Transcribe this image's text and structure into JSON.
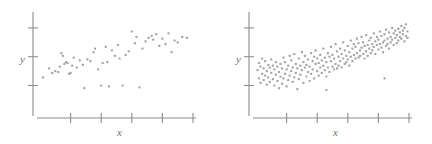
{
  "figure": {
    "background": "#ffffff",
    "dot_color": "#a6a6a6",
    "axis_color": "#8c8c8c",
    "label_color": "#6f6f6f",
    "width": 432,
    "height": 144
  },
  "chart_data": [
    {
      "type": "scatter",
      "title": "",
      "xlabel": "x",
      "ylabel": "y",
      "panel": "left",
      "grid": false,
      "legend": null,
      "xlim": [
        0,
        100
      ],
      "ylim": [
        0,
        100
      ],
      "x_ticks": [
        20,
        40,
        60,
        80,
        100
      ],
      "y_ticks": [
        25,
        57,
        89
      ],
      "n_points": 55,
      "correlation": "weak positive",
      "points": [
        [
          2,
          34
        ],
        [
          6,
          44
        ],
        [
          8,
          39
        ],
        [
          10,
          41
        ],
        [
          12,
          40
        ],
        [
          13,
          46
        ],
        [
          14,
          61
        ],
        [
          15,
          58
        ],
        [
          16,
          49
        ],
        [
          17,
          51
        ],
        [
          18,
          50
        ],
        [
          19,
          38
        ],
        [
          20,
          39
        ],
        [
          21,
          47
        ],
        [
          22,
          56
        ],
        [
          24,
          45
        ],
        [
          26,
          53
        ],
        [
          28,
          48
        ],
        [
          29,
          22
        ],
        [
          31,
          54
        ],
        [
          33,
          52
        ],
        [
          35,
          62
        ],
        [
          36,
          66
        ],
        [
          38,
          43
        ],
        [
          40,
          25
        ],
        [
          41,
          50
        ],
        [
          43,
          68
        ],
        [
          44,
          51
        ],
        [
          45,
          24
        ],
        [
          47,
          64
        ],
        [
          49,
          58
        ],
        [
          51,
          70
        ],
        [
          52,
          55
        ],
        [
          54,
          25
        ],
        [
          56,
          59
        ],
        [
          58,
          63
        ],
        [
          60,
          85
        ],
        [
          62,
          72
        ],
        [
          63,
          79
        ],
        [
          65,
          23
        ],
        [
          67,
          66
        ],
        [
          69,
          74
        ],
        [
          71,
          78
        ],
        [
          73,
          80
        ],
        [
          74,
          76
        ],
        [
          76,
          82
        ],
        [
          78,
          69
        ],
        [
          80,
          77
        ],
        [
          82,
          71
        ],
        [
          84,
          83
        ],
        [
          86,
          62
        ],
        [
          88,
          75
        ],
        [
          90,
          73
        ],
        [
          93,
          79
        ],
        [
          96,
          78
        ]
      ]
    },
    {
      "type": "scatter",
      "title": "",
      "xlabel": "x",
      "ylabel": "y",
      "panel": "right",
      "grid": false,
      "legend": null,
      "xlim": [
        0,
        100
      ],
      "ylim": [
        0,
        100
      ],
      "x_ticks": [
        20,
        40,
        60,
        80,
        100
      ],
      "y_ticks": [
        25,
        57,
        89
      ],
      "n_points": 200,
      "correlation": "moderate positive",
      "points": [
        [
          1,
          42
        ],
        [
          2,
          33
        ],
        [
          2,
          50
        ],
        [
          3,
          28
        ],
        [
          3,
          46
        ],
        [
          4,
          38
        ],
        [
          4,
          55
        ],
        [
          5,
          31
        ],
        [
          5,
          44
        ],
        [
          6,
          36
        ],
        [
          6,
          52
        ],
        [
          7,
          26
        ],
        [
          7,
          41
        ],
        [
          8,
          48
        ],
        [
          8,
          34
        ],
        [
          9,
          29
        ],
        [
          9,
          45
        ],
        [
          10,
          39
        ],
        [
          10,
          54
        ],
        [
          11,
          32
        ],
        [
          11,
          47
        ],
        [
          12,
          25
        ],
        [
          12,
          43
        ],
        [
          13,
          37
        ],
        [
          13,
          51
        ],
        [
          14,
          30
        ],
        [
          14,
          46
        ],
        [
          15,
          22
        ],
        [
          15,
          40
        ],
        [
          16,
          35
        ],
        [
          16,
          49
        ],
        [
          17,
          27
        ],
        [
          17,
          44
        ],
        [
          18,
          56
        ],
        [
          18,
          33
        ],
        [
          19,
          38
        ],
        [
          19,
          51
        ],
        [
          20,
          24
        ],
        [
          20,
          43
        ],
        [
          21,
          47
        ],
        [
          21,
          31
        ],
        [
          22,
          58
        ],
        [
          22,
          36
        ],
        [
          23,
          41
        ],
        [
          23,
          53
        ],
        [
          24,
          29
        ],
        [
          24,
          45
        ],
        [
          25,
          34
        ],
        [
          25,
          60
        ],
        [
          26,
          39
        ],
        [
          26,
          49
        ],
        [
          27,
          21
        ],
        [
          27,
          44
        ],
        [
          28,
          55
        ],
        [
          28,
          32
        ],
        [
          29,
          47
        ],
        [
          29,
          37
        ],
        [
          30,
          62
        ],
        [
          30,
          42
        ],
        [
          31,
          51
        ],
        [
          31,
          28
        ],
        [
          32,
          45
        ],
        [
          32,
          58
        ],
        [
          33,
          35
        ],
        [
          33,
          48
        ],
        [
          34,
          40
        ],
        [
          34,
          54
        ],
        [
          35,
          30
        ],
        [
          35,
          46
        ],
        [
          36,
          61
        ],
        [
          36,
          38
        ],
        [
          37,
          52
        ],
        [
          37,
          43
        ],
        [
          38,
          57
        ],
        [
          38,
          33
        ],
        [
          39,
          49
        ],
        [
          39,
          64
        ],
        [
          40,
          41
        ],
        [
          40,
          55
        ],
        [
          41,
          36
        ],
        [
          41,
          50
        ],
        [
          42,
          45
        ],
        [
          42,
          59
        ],
        [
          43,
          39
        ],
        [
          43,
          53
        ],
        [
          44,
          66
        ],
        [
          44,
          47
        ],
        [
          45,
          42
        ],
        [
          45,
          56
        ],
        [
          46,
          35
        ],
        [
          46,
          51
        ],
        [
          47,
          61
        ],
        [
          47,
          45
        ],
        [
          48,
          57
        ],
        [
          48,
          40
        ],
        [
          49,
          52
        ],
        [
          49,
          68
        ],
        [
          50,
          46
        ],
        [
          50,
          59
        ],
        [
          51,
          43
        ],
        [
          51,
          55
        ],
        [
          52,
          71
        ],
        [
          52,
          49
        ],
        [
          53,
          63
        ],
        [
          53,
          44
        ],
        [
          54,
          57
        ],
        [
          54,
          47
        ],
        [
          55,
          66
        ],
        [
          55,
          52
        ],
        [
          56,
          60
        ],
        [
          56,
          45
        ],
        [
          57,
          73
        ],
        [
          57,
          55
        ],
        [
          58,
          49
        ],
        [
          58,
          64
        ],
        [
          59,
          58
        ],
        [
          59,
          51
        ],
        [
          60,
          69
        ],
        [
          60,
          54
        ],
        [
          61,
          62
        ],
        [
          61,
          47
        ],
        [
          62,
          75
        ],
        [
          62,
          57
        ],
        [
          63,
          66
        ],
        [
          63,
          52
        ],
        [
          64,
          71
        ],
        [
          64,
          59
        ],
        [
          65,
          55
        ],
        [
          65,
          68
        ],
        [
          66,
          77
        ],
        [
          66,
          61
        ],
        [
          67,
          56
        ],
        [
          67,
          72
        ],
        [
          68,
          64
        ],
        [
          68,
          58
        ],
        [
          69,
          79
        ],
        [
          69,
          67
        ],
        [
          70,
          60
        ],
        [
          70,
          73
        ],
        [
          71,
          55
        ],
        [
          71,
          69
        ],
        [
          72,
          81
        ],
        [
          72,
          63
        ],
        [
          73,
          70
        ],
        [
          73,
          58
        ],
        [
          74,
          75
        ],
        [
          74,
          66
        ],
        [
          75,
          61
        ],
        [
          75,
          78
        ],
        [
          76,
          71
        ],
        [
          76,
          64
        ],
        [
          77,
          83
        ],
        [
          77,
          68
        ],
        [
          78,
          74
        ],
        [
          78,
          60
        ],
        [
          79,
          79
        ],
        [
          79,
          70
        ],
        [
          80,
          65
        ],
        [
          80,
          76
        ],
        [
          81,
          85
        ],
        [
          81,
          71
        ],
        [
          82,
          67
        ],
        [
          82,
          80
        ],
        [
          83,
          73
        ],
        [
          83,
          62
        ],
        [
          84,
          82
        ],
        [
          84,
          75
        ],
        [
          85,
          69
        ],
        [
          85,
          87
        ],
        [
          86,
          77
        ],
        [
          86,
          71
        ],
        [
          87,
          84
        ],
        [
          87,
          66
        ],
        [
          88,
          79
        ],
        [
          88,
          73
        ],
        [
          89,
          89
        ],
        [
          89,
          76
        ],
        [
          90,
          70
        ],
        [
          90,
          83
        ],
        [
          91,
          78
        ],
        [
          91,
          86
        ],
        [
          92,
          72
        ],
        [
          92,
          81
        ],
        [
          93,
          88
        ],
        [
          93,
          75
        ],
        [
          94,
          84
        ],
        [
          94,
          79
        ],
        [
          95,
          91
        ],
        [
          95,
          77
        ],
        [
          96,
          86
        ],
        [
          96,
          82
        ],
        [
          97,
          74
        ],
        [
          97,
          89
        ],
        [
          98,
          80
        ],
        [
          98,
          93
        ],
        [
          99,
          85
        ],
        [
          99,
          78
        ],
        [
          46,
          20
        ],
        [
          84,
          33
        ]
      ]
    }
  ]
}
